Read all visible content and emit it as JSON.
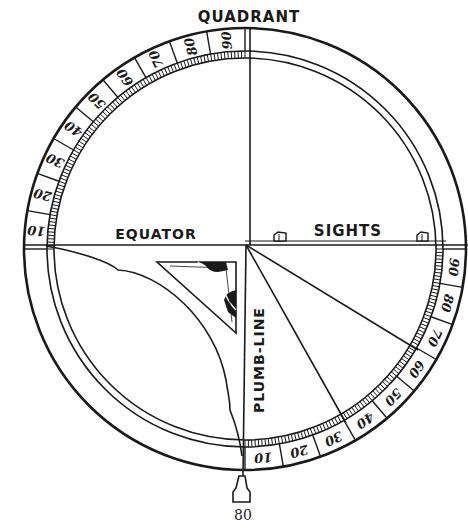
{
  "figure": {
    "title": "QUADRANT",
    "labels": {
      "equator": "EQUATOR",
      "sights": "SIGHTS",
      "plumb_line": "PLUMB-LINE"
    },
    "upper_left_scale": [
      "10",
      "20",
      "30",
      "40",
      "50",
      "60",
      "70",
      "80",
      "90"
    ],
    "lower_right_scale": [
      "10",
      "20",
      "30",
      "40",
      "50",
      "60",
      "70",
      "80",
      "90"
    ],
    "page_number": "80"
  },
  "colors": {
    "ink": "#1a1a1a",
    "paper": "#ffffff"
  }
}
